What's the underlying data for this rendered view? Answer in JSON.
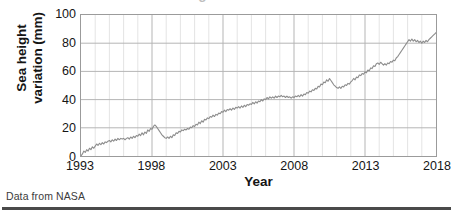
{
  "figure": {
    "title": "Global average sea level rise 1993–2018",
    "source_note": "Data from NASA"
  },
  "chart_data": {
    "type": "line",
    "title": "Global average sea level rise 1993–2018",
    "xlabel": "Year",
    "ylabel": "Sea height variation (mm)",
    "ylabel_lines": [
      "Sea height",
      "variation (mm)"
    ],
    "xlim": [
      1993,
      2018
    ],
    "ylim": [
      0,
      100
    ],
    "xticks": [
      1993,
      1998,
      2003,
      2008,
      2013,
      2018
    ],
    "yticks": [
      0,
      20,
      40,
      60,
      80,
      100
    ],
    "xtick_labels": [
      "1993",
      "1998",
      "2003",
      "2008",
      "2013",
      "2018"
    ],
    "ytick_labels": [
      "0",
      "20",
      "40",
      "60",
      "80",
      "100"
    ],
    "grid": {
      "horizontal_major": true,
      "vertical_major": true,
      "vertical_minor_interval_years": 1,
      "major_color": "#b4b4b4",
      "minor_color": "#e4e4e4"
    },
    "legend": null,
    "line_color": "#8d8d8d",
    "line_width": 1.1,
    "series": [
      {
        "name": "Sea height variation",
        "units": "mm",
        "x": [
          1993.0,
          1993.1,
          1993.2,
          1993.3,
          1993.4,
          1993.5,
          1993.6,
          1993.7,
          1993.8,
          1993.9,
          1994.0,
          1994.1,
          1994.2,
          1994.3,
          1994.4,
          1994.5,
          1994.6,
          1994.7,
          1994.8,
          1994.9,
          1995.0,
          1995.1,
          1995.2,
          1995.3,
          1995.4,
          1995.5,
          1995.6,
          1995.7,
          1995.8,
          1995.9,
          1996.0,
          1996.1,
          1996.2,
          1996.3,
          1996.4,
          1996.5,
          1996.6,
          1996.7,
          1996.8,
          1996.9,
          1997.0,
          1997.1,
          1997.2,
          1997.3,
          1997.4,
          1997.5,
          1997.6,
          1997.7,
          1997.8,
          1997.9,
          1998.0,
          1998.1,
          1998.2,
          1998.3,
          1998.4,
          1998.5,
          1998.6,
          1998.7,
          1998.8,
          1998.9,
          1999.0,
          1999.1,
          1999.2,
          1999.3,
          1999.4,
          1999.5,
          1999.6,
          1999.7,
          1999.8,
          1999.9,
          2000.0,
          2000.1,
          2000.2,
          2000.3,
          2000.4,
          2000.5,
          2000.6,
          2000.7,
          2000.8,
          2000.9,
          2001.0,
          2001.1,
          2001.2,
          2001.3,
          2001.4,
          2001.5,
          2001.6,
          2001.7,
          2001.8,
          2001.9,
          2002.0,
          2002.1,
          2002.2,
          2002.3,
          2002.4,
          2002.5,
          2002.6,
          2002.7,
          2002.8,
          2002.9,
          2003.0,
          2003.1,
          2003.2,
          2003.3,
          2003.4,
          2003.5,
          2003.6,
          2003.7,
          2003.8,
          2003.9,
          2004.0,
          2004.1,
          2004.2,
          2004.3,
          2004.4,
          2004.5,
          2004.6,
          2004.7,
          2004.8,
          2004.9,
          2005.0,
          2005.1,
          2005.2,
          2005.3,
          2005.4,
          2005.5,
          2005.6,
          2005.7,
          2005.8,
          2005.9,
          2006.0,
          2006.1,
          2006.2,
          2006.3,
          2006.4,
          2006.5,
          2006.6,
          2006.7,
          2006.8,
          2006.9,
          2007.0,
          2007.1,
          2007.2,
          2007.3,
          2007.4,
          2007.5,
          2007.6,
          2007.7,
          2007.8,
          2007.9,
          2008.0,
          2008.1,
          2008.2,
          2008.3,
          2008.4,
          2008.5,
          2008.6,
          2008.7,
          2008.8,
          2008.9,
          2009.0,
          2009.1,
          2009.2,
          2009.3,
          2009.4,
          2009.5,
          2009.6,
          2009.7,
          2009.8,
          2009.9,
          2010.0,
          2010.1,
          2010.2,
          2010.3,
          2010.4,
          2010.5,
          2010.6,
          2010.7,
          2010.8,
          2010.9,
          2011.0,
          2011.1,
          2011.2,
          2011.3,
          2011.4,
          2011.5,
          2011.6,
          2011.7,
          2011.8,
          2011.9,
          2012.0,
          2012.1,
          2012.2,
          2012.3,
          2012.4,
          2012.5,
          2012.6,
          2012.7,
          2012.8,
          2012.9,
          2013.0,
          2013.1,
          2013.2,
          2013.3,
          2013.4,
          2013.5,
          2013.6,
          2013.7,
          2013.8,
          2013.9,
          2014.0,
          2014.1,
          2014.2,
          2014.3,
          2014.4,
          2014.5,
          2014.6,
          2014.7,
          2014.8,
          2014.9,
          2015.0,
          2015.1,
          2015.2,
          2015.3,
          2015.4,
          2015.5,
          2015.6,
          2015.7,
          2015.8,
          2015.9,
          2016.0,
          2016.1,
          2016.2,
          2016.3,
          2016.4,
          2016.5,
          2016.6,
          2016.7,
          2016.8,
          2016.9,
          2017.0,
          2017.1,
          2017.2,
          2017.3,
          2017.4,
          2017.5,
          2017.6,
          2017.7,
          2017.8,
          2017.9,
          2018.0
        ],
        "values": [
          0.0,
          1.5,
          3.5,
          2.5,
          4.5,
          3.5,
          5.5,
          4.5,
          6.5,
          5.5,
          7.0,
          8.5,
          7.5,
          9.0,
          8.0,
          9.5,
          8.5,
          10.0,
          9.5,
          10.5,
          11.0,
          10.0,
          11.5,
          10.5,
          12.0,
          11.0,
          12.5,
          11.5,
          12.5,
          12.0,
          12.5,
          11.5,
          12.5,
          13.0,
          12.0,
          13.5,
          12.5,
          14.0,
          13.0,
          14.5,
          14.0,
          15.5,
          14.5,
          16.5,
          15.0,
          17.0,
          16.0,
          18.5,
          17.5,
          19.5,
          19.0,
          21.0,
          22.0,
          21.0,
          19.5,
          18.0,
          16.5,
          15.0,
          14.0,
          13.0,
          12.5,
          13.5,
          12.5,
          14.0,
          13.0,
          15.0,
          14.5,
          16.5,
          16.0,
          17.5,
          17.0,
          18.5,
          18.0,
          19.0,
          18.5,
          19.5,
          19.0,
          20.5,
          20.0,
          21.5,
          21.0,
          22.5,
          22.0,
          24.0,
          23.0,
          25.0,
          24.0,
          26.0,
          25.5,
          27.0,
          26.5,
          28.0,
          27.5,
          29.0,
          28.0,
          29.5,
          29.0,
          30.5,
          30.0,
          31.5,
          31.0,
          32.5,
          31.5,
          33.0,
          32.5,
          33.5,
          32.5,
          34.0,
          33.0,
          34.5,
          34.0,
          35.0,
          34.0,
          35.5,
          34.5,
          36.0,
          35.0,
          36.5,
          36.0,
          37.0,
          36.5,
          38.0,
          37.0,
          38.5,
          37.5,
          39.0,
          38.5,
          40.0,
          39.0,
          40.5,
          40.0,
          41.5,
          40.5,
          42.0,
          41.0,
          42.0,
          41.0,
          42.5,
          41.5,
          42.5,
          42.0,
          43.0,
          42.0,
          42.5,
          41.5,
          42.5,
          41.5,
          42.0,
          41.0,
          42.0,
          41.5,
          42.5,
          42.0,
          43.0,
          42.0,
          43.5,
          42.5,
          44.0,
          43.5,
          45.0,
          44.5,
          46.0,
          45.5,
          47.0,
          46.5,
          48.0,
          47.5,
          49.5,
          49.0,
          51.0,
          50.5,
          52.5,
          52.0,
          54.0,
          53.0,
          55.0,
          53.5,
          52.0,
          50.5,
          49.5,
          48.5,
          48.0,
          49.0,
          48.0,
          49.5,
          49.0,
          50.5,
          50.0,
          51.5,
          51.0,
          52.5,
          53.5,
          55.0,
          54.0,
          56.0,
          55.5,
          57.5,
          57.0,
          58.5,
          58.0,
          59.5,
          59.0,
          61.0,
          60.5,
          62.5,
          62.0,
          64.0,
          63.5,
          65.5,
          66.0,
          65.0,
          66.5,
          65.5,
          64.5,
          65.5,
          64.5,
          66.0,
          65.5,
          67.0,
          66.5,
          68.0,
          67.5,
          69.5,
          70.5,
          72.0,
          73.5,
          75.0,
          76.5,
          78.0,
          79.5,
          81.0,
          82.5,
          81.5,
          83.0,
          81.5,
          82.5,
          81.0,
          82.0,
          80.5,
          81.5,
          80.0,
          81.5,
          80.5,
          82.0,
          81.0,
          82.5,
          83.5,
          84.5,
          85.5,
          86.5,
          87.5
        ]
      }
    ],
    "annotations": []
  },
  "axes": {
    "y_title_line1": "Sea height",
    "y_title_line2": "variation (mm)",
    "x_title": "Year"
  }
}
